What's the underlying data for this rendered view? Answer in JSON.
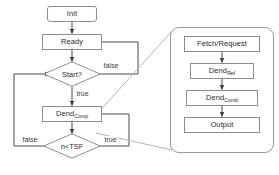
{
  "diagram": {
    "colors": {
      "node_border": "#8d8d8d",
      "node_fill": "#ffffff",
      "wire": "#4a4a4a",
      "panel_border": "#9a9a9a",
      "text": "#2b2b2b",
      "background": "#ffffff"
    },
    "main_flow": {
      "nodes": [
        {
          "id": "init",
          "label": "Init",
          "shape": "rounded-rect"
        },
        {
          "id": "ready",
          "label": "Ready",
          "shape": "rect"
        },
        {
          "id": "start",
          "label": "Start?",
          "shape": "diamond"
        },
        {
          "id": "dend_comp",
          "label": "Dend",
          "subscript": "Comp",
          "shape": "rect"
        },
        {
          "id": "ntsf",
          "label": "n<TSF",
          "shape": "diamond"
        }
      ],
      "edge_labels": [
        {
          "id": "start-false",
          "text": "false"
        },
        {
          "id": "start-true",
          "text": "true"
        },
        {
          "id": "ntsf-false",
          "text": "false"
        },
        {
          "id": "ntsf-true",
          "text": "true"
        }
      ]
    },
    "detail_panel": {
      "nodes": [
        {
          "id": "fetch",
          "label": "Fetch/Request",
          "shape": "rect"
        },
        {
          "id": "dend_ref",
          "label": "Dend",
          "subscript": "Ref",
          "shape": "rect"
        },
        {
          "id": "dend_comb",
          "label": "Dend",
          "subscript": "Comb",
          "shape": "rect"
        },
        {
          "id": "output",
          "label": "Output",
          "shape": "rect"
        }
      ]
    }
  }
}
